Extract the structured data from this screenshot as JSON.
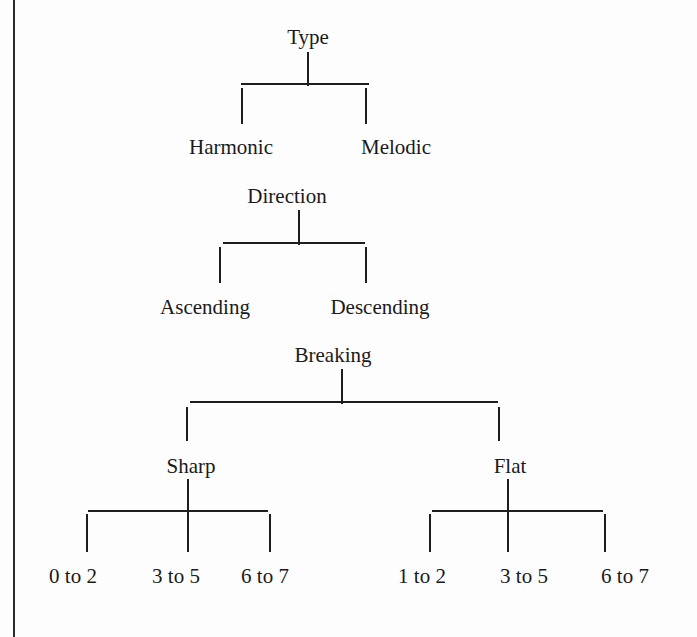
{
  "diagram": {
    "type": "tree",
    "trees": [
      {
        "root": "Type",
        "children": [
          "Harmonic",
          "Melodic"
        ]
      },
      {
        "root": "Direction",
        "children": [
          "Ascending",
          "Descending"
        ]
      },
      {
        "root": "Breaking",
        "children": [
          {
            "label": "Sharp",
            "children": [
              "0 to 2",
              "3 to 5",
              "6 to 7"
            ]
          },
          {
            "label": "Flat",
            "children": [
              "1 to 2",
              "3 to 5",
              "6 to 7"
            ]
          }
        ]
      }
    ]
  },
  "labels": {
    "type": "Type",
    "harmonic": "Harmonic",
    "melodic": "Melodic",
    "direction": "Direction",
    "ascending": "Ascending",
    "descending": "Descending",
    "breaking": "Breaking",
    "sharp": "Sharp",
    "flat": "Flat",
    "sharp_leaves": [
      "0 to 2",
      "3 to 5",
      "6 to 7"
    ],
    "flat_leaves": [
      "1 to 2",
      "3 to 5",
      "6 to 7"
    ]
  },
  "colors": {
    "ink": "#1a1a1a",
    "background": "#fdfdfd"
  }
}
